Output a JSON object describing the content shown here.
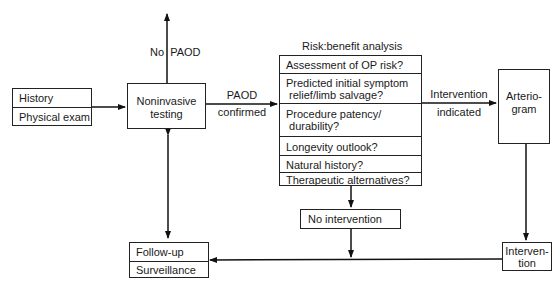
{
  "history_box": {
    "items": [
      "History",
      "Physical exam"
    ]
  },
  "noninvasive_box": {
    "lines": [
      "Noninvasive",
      "testing"
    ]
  },
  "no_paod_label": "No  PAOD",
  "paod_confirmed_label": [
    "PAOD",
    "confirmed"
  ],
  "risk_benefit": {
    "title": "Risk:benefit analysis",
    "items": [
      [
        "Assessment of OP risk?"
      ],
      [
        "Predicted initial symptom",
        " relief/limb salvage?"
      ],
      [
        "Procedure patency/",
        " durability?"
      ],
      [
        "Longevity outlook?"
      ],
      [
        "Natural history?"
      ],
      [
        "Therapeutic alternatives?"
      ]
    ]
  },
  "intervention_indicated_label": [
    "Intervention",
    "indicated"
  ],
  "arteriogram_box": {
    "lines": [
      "Arterio-",
      "gram"
    ]
  },
  "no_intervention_box": "No intervention",
  "intervention_box": {
    "lines": [
      "Interven-",
      "tion"
    ]
  },
  "followup_box": {
    "items": [
      "Follow-up",
      "Surveillance"
    ]
  }
}
